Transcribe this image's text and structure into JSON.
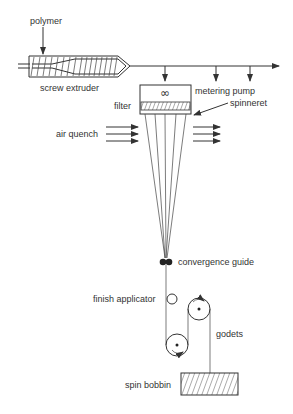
{
  "diagram": {
    "labels": {
      "polymer": "polymer",
      "screw_extruder": "screw extruder",
      "metering_pump": "metering pump",
      "filter": "filter",
      "spinneret": "spinneret",
      "air_quench": "air quench",
      "convergence_guide": "convergence guide",
      "finish_applicator": "finish applicator",
      "godets": "godets",
      "spin_bobbin": "spin bobbin"
    },
    "pump_symbol": "∞",
    "colors": {
      "line": "#333333",
      "background": "#ffffff"
    }
  }
}
